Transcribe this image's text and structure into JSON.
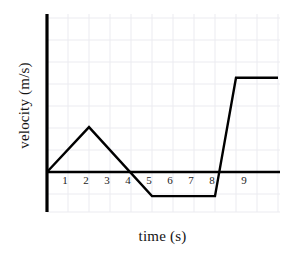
{
  "figure": {
    "background_color": "#ffffff",
    "width": 284,
    "height": 260
  },
  "axes": {
    "x_title": "time (s)",
    "y_title": "velocity (m/s)",
    "x_tick_labels": [
      "1",
      "2",
      "3",
      "4",
      "5",
      "6",
      "7",
      "8",
      "9"
    ],
    "y_tick_labels": []
  },
  "style": {
    "line_color": "#000000",
    "axis_color": "#000000",
    "grid_color": "#ebebf0",
    "text_color": "#141414",
    "line_width": 2.4,
    "axis_width": 3.0
  },
  "chart_data": {
    "type": "line",
    "title": "",
    "xlabel": "time (s)",
    "ylabel": "velocity (m/s)",
    "xlim": [
      0,
      11
    ],
    "ylim": [
      -1.5,
      7.2
    ],
    "grid": true,
    "legend": null,
    "x_ticks": [
      1,
      2,
      3,
      4,
      5,
      6,
      7,
      8,
      9
    ],
    "y_ticks": [],
    "zero_line": true,
    "series": [
      {
        "name": "velocity",
        "x": [
          0,
          2,
          5,
          8,
          9,
          11
        ],
        "y": [
          0,
          2.05,
          -1.1,
          -1.1,
          4.3,
          4.3
        ],
        "description": "Rises linearly from 0 at t=0 to a peak at t=2, falls linearly crossing zero at t=4 down to a constant negative value at t=5, stays constant until t=8, then rises steeply to a high constant value at t=9 and remains flat."
      }
    ],
    "segments": [
      {
        "label": "acceleration",
        "from_t": 0,
        "to_t": 2,
        "from_v": 0,
        "to_v": 2.05
      },
      {
        "label": "deceleration",
        "from_t": 2,
        "to_t": 5,
        "from_v": 2.05,
        "to_v": -1.1
      },
      {
        "label": "constant-negative",
        "from_t": 5,
        "to_t": 8,
        "from_v": -1.1,
        "to_v": -1.1
      },
      {
        "label": "steep-acceleration",
        "from_t": 8,
        "to_t": 9,
        "from_v": -1.1,
        "to_v": 4.3
      },
      {
        "label": "constant-positive",
        "from_t": 9,
        "to_t": 11,
        "from_v": 4.3,
        "to_v": 4.3
      }
    ]
  }
}
